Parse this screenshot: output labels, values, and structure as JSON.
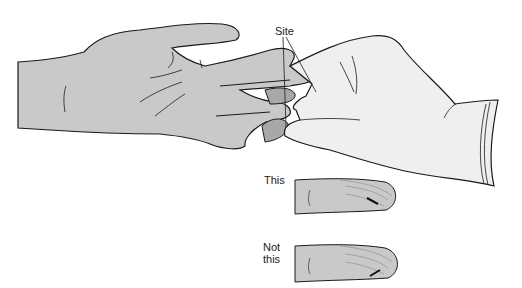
{
  "figure": {
    "type": "medical-illustration",
    "labels": {
      "site": "Site",
      "this": "This",
      "not_this_line1": "Not",
      "not_this_line2": "this"
    },
    "colors": {
      "background": "#ffffff",
      "skin": "#c9c9c9",
      "skin_dark": "#a8a8a8",
      "glove": "#efefef",
      "outline": "#1a1a1a",
      "text": "#222222"
    }
  }
}
